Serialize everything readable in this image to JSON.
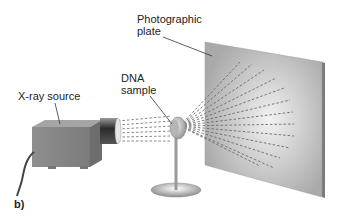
{
  "diagram": {
    "panel_label": "b)",
    "labels": {
      "photographic_plate_line1": "Photographic",
      "photographic_plate_line2": "plate",
      "dna_sample_line1": "DNA",
      "dna_sample_line2": "sample",
      "xray_source": "X-ray source"
    },
    "components": [
      {
        "name": "X-ray source",
        "shape": "box"
      },
      {
        "name": "DNA sample",
        "shape": "disc on stand"
      },
      {
        "name": "Photographic plate",
        "shape": "panel"
      }
    ],
    "colors": {
      "background": "#ffffff",
      "source_box": "#8a8a8a",
      "plate": "#b8b8b8",
      "beam_dash": "#6a6a6a",
      "text": "#222222"
    }
  }
}
